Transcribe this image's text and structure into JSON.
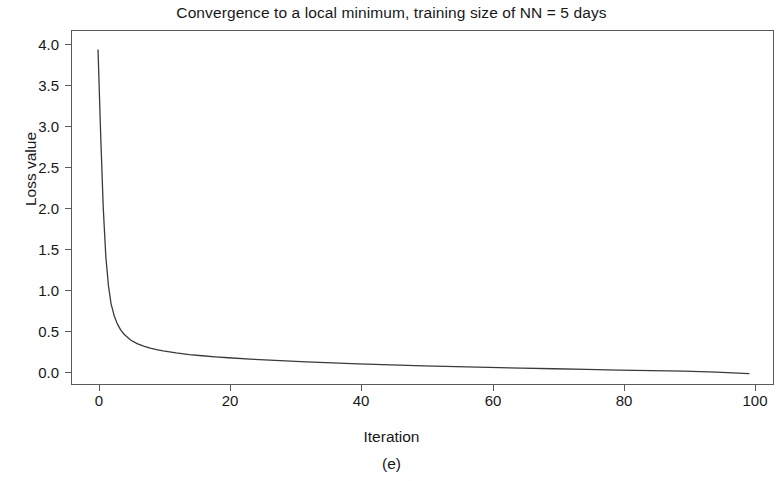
{
  "chart_data": {
    "type": "line",
    "title": "Convergence to a local minimum, training size of NN = 5 days",
    "xlabel": "Iteration",
    "ylabel": "Loss value",
    "caption": "(e)",
    "grid": false,
    "legend": null,
    "xlim": [
      -4,
      104
    ],
    "ylim": [
      -0.07,
      4.25
    ],
    "xticks": [
      0,
      20,
      40,
      60,
      80,
      100
    ],
    "xtick_labels": [
      "0",
      "20",
      "40",
      "60",
      "80",
      "100"
    ],
    "yticks": [
      0.0,
      0.5,
      1.0,
      1.5,
      2.0,
      2.5,
      3.0,
      3.5,
      4.0
    ],
    "ytick_labels": [
      "0.0",
      "0.5",
      "1.0",
      "1.5",
      "2.0",
      "2.5",
      "3.0",
      "3.5",
      "4.0"
    ],
    "line_color": "#3a3a3a",
    "background_color": "#ffffff",
    "series": [
      {
        "name": "Loss",
        "x": [
          0,
          0.4,
          0.8,
          1.2,
          1.6,
          2,
          2.5,
          3,
          3.5,
          4,
          5,
          6,
          7,
          8,
          9,
          10,
          12,
          14,
          16,
          18,
          20,
          24,
          28,
          32,
          36,
          40,
          45,
          50,
          55,
          60,
          65,
          70,
          75,
          80,
          85,
          90,
          95,
          100
        ],
        "y": [
          4.02,
          3.0,
          2.1,
          1.5,
          1.15,
          0.93,
          0.78,
          0.68,
          0.61,
          0.56,
          0.49,
          0.445,
          0.415,
          0.39,
          0.372,
          0.357,
          0.332,
          0.313,
          0.298,
          0.285,
          0.274,
          0.254,
          0.238,
          0.224,
          0.211,
          0.2,
          0.187,
          0.176,
          0.166,
          0.157,
          0.148,
          0.14,
          0.132,
          0.124,
          0.117,
          0.11,
          0.1,
          0.08
        ]
      }
    ]
  }
}
